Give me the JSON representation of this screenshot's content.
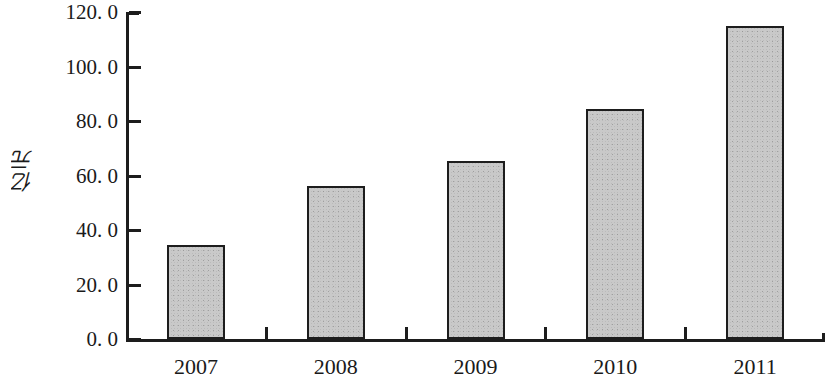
{
  "chart_data": {
    "type": "bar",
    "title": "",
    "xlabel": "",
    "ylabel": "亿元",
    "categories": [
      "2007",
      "2008",
      "2009",
      "2010",
      "2011"
    ],
    "values": [
      34.5,
      56.0,
      65.5,
      84.5,
      115.0
    ],
    "series": [
      {
        "name": "",
        "values": [
          34.5,
          56.0,
          65.5,
          84.5,
          115.0
        ]
      }
    ],
    "ylim": [
      0,
      120
    ],
    "ytick_step": 20,
    "ytick_values": [
      0,
      20,
      40,
      60,
      80,
      100,
      120
    ],
    "ytick_labels": [
      "0. 0",
      "20. 0",
      "40. 0",
      "60. 0",
      "80. 0",
      "100. 0",
      "120. 0"
    ],
    "xtick_labels": [
      "2007",
      "2008",
      "2009",
      "2010",
      "2011"
    ],
    "grid": false,
    "legend": false,
    "legend_position": "none",
    "bar_color": "#c9c9c9",
    "bar_border_color": "#1d1d1d",
    "axis_color": "#1d1d1d",
    "background_color": "#ffffff"
  }
}
